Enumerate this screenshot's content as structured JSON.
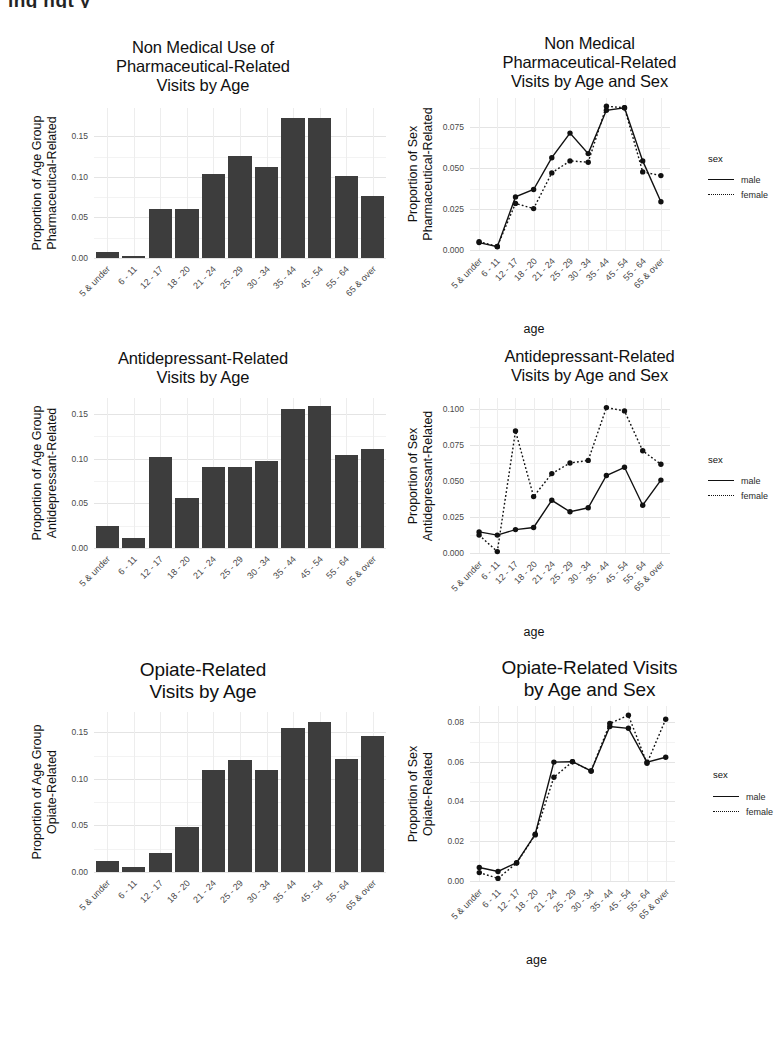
{
  "top_cropped_text": "ing ngt y",
  "categories": [
    "5 & under",
    "6 - 11",
    "12 - 17",
    "18 - 20",
    "21 - 24",
    "25 - 29",
    "30 - 34",
    "35 - 44",
    "45 - 54",
    "55 - 64",
    "65 & over"
  ],
  "legend": {
    "title": "sex",
    "items": [
      {
        "label": "male",
        "style": "solid"
      },
      {
        "label": "female",
        "style": "dotted"
      }
    ]
  },
  "axis_title_x": "age",
  "panels": [
    {
      "id": "p1",
      "title_lines": [
        "Non Medical Use of",
        "Pharmaceutical-Related",
        "Visits by Age"
      ],
      "ylabel_lines": [
        "Proportion of Age Group",
        "Pharmaceutical-Related"
      ]
    },
    {
      "id": "p2",
      "title_lines": [
        "Non Medical",
        "Pharmaceutical-Related",
        "Visits by Age and Sex"
      ],
      "ylabel_lines": [
        "Proportion of Sex",
        "Pharmaceutical-Related"
      ]
    },
    {
      "id": "p3",
      "title_lines": [
        "Antidepressant-Related",
        "Visits by Age"
      ],
      "ylabel_lines": [
        "Proportion of Age Group",
        "Antidepressant-Related"
      ]
    },
    {
      "id": "p4",
      "title_lines": [
        "Antidepressant-Related",
        "Visits by Age and Sex"
      ],
      "ylabel_lines": [
        "Proportion of Sex",
        "Antidepressant-Related"
      ]
    },
    {
      "id": "p5",
      "title_lines": [
        "Opiate-Related",
        "Visits by Age"
      ],
      "ylabel_lines": [
        "Proportion of Age Group",
        "Opiate-Related"
      ]
    },
    {
      "id": "p6",
      "title_lines": [
        "Opiate-Related Visits",
        "by Age and Sex"
      ],
      "ylabel_lines": [
        "Proportion of Sex",
        "Opiate-Related"
      ]
    }
  ],
  "chart_data": [
    {
      "type": "bar",
      "panel": "p1",
      "title": "Non Medical Use of Pharmaceutical-Related Visits by Age",
      "xlabel": "",
      "ylabel": "Proportion of Age Group Pharmaceutical-Related",
      "categories": [
        "5 & under",
        "6 - 11",
        "12 - 17",
        "18 - 20",
        "21 - 24",
        "25 - 29",
        "30 - 34",
        "35 - 44",
        "45 - 54",
        "55 - 64",
        "65 & over"
      ],
      "values": [
        0.007,
        0.002,
        0.06,
        0.061,
        0.104,
        0.126,
        0.112,
        0.173,
        0.173,
        0.101,
        0.076
      ],
      "ylim": [
        0,
        0.185
      ],
      "yticks": [
        0.0,
        0.05,
        0.1,
        0.15
      ],
      "yticklabels": [
        "0.00",
        "0.05",
        "0.10",
        "0.15"
      ],
      "grid": true,
      "bar_color": "#3d3d3d"
    },
    {
      "type": "line",
      "panel": "p2",
      "title": "Non Medical Pharmaceutical-Related Visits by Age and Sex",
      "xlabel": "age",
      "ylabel": "Proportion of Sex Pharmaceutical-Related",
      "x": [
        "5 & under",
        "6 - 11",
        "12 - 17",
        "18 - 20",
        "21 - 24",
        "25 - 29",
        "30 - 34",
        "35 - 44",
        "45 - 54",
        "55 - 64",
        "65 & over"
      ],
      "series": [
        {
          "name": "male",
          "style": "solid",
          "values": [
            0.0045,
            0.002,
            0.0325,
            0.037,
            0.0565,
            0.0715,
            0.059,
            0.0855,
            0.087,
            0.0545,
            0.0295
          ]
        },
        {
          "name": "female",
          "style": "dotted",
          "values": [
            0.005,
            0.0022,
            0.0285,
            0.0253,
            0.0472,
            0.0545,
            0.0537,
            0.088,
            0.087,
            0.0478,
            0.0455
          ]
        }
      ],
      "ylim": [
        0,
        0.093
      ],
      "yticks": [
        0.0,
        0.025,
        0.05,
        0.075
      ],
      "yticklabels": [
        "0.000",
        "0.025",
        "0.050",
        "0.075"
      ],
      "grid": true,
      "legend": {
        "title": "sex",
        "position": "right"
      }
    },
    {
      "type": "bar",
      "panel": "p3",
      "title": "Antidepressant-Related Visits by Age",
      "xlabel": "",
      "ylabel": "Proportion of Age Group Antidepressant-Related",
      "categories": [
        "5 & under",
        "6 - 11",
        "12 - 17",
        "18 - 20",
        "21 - 24",
        "25 - 29",
        "30 - 34",
        "35 - 44",
        "45 - 54",
        "55 - 64",
        "65 & over"
      ],
      "values": [
        0.025,
        0.011,
        0.102,
        0.056,
        0.091,
        0.091,
        0.097,
        0.156,
        0.159,
        0.104,
        0.111
      ],
      "ylim": [
        0,
        0.168
      ],
      "yticks": [
        0.0,
        0.05,
        0.1,
        0.15
      ],
      "yticklabels": [
        "0.00",
        "0.05",
        "0.10",
        "0.15"
      ],
      "grid": true,
      "bar_color": "#3d3d3d"
    },
    {
      "type": "line",
      "panel": "p4",
      "title": "Antidepressant-Related Visits by Age and Sex",
      "xlabel": "age",
      "ylabel": "Proportion of Sex Antidepressant-Related",
      "x": [
        "5 & under",
        "6 - 11",
        "12 - 17",
        "18 - 20",
        "21 - 24",
        "25 - 29",
        "30 - 34",
        "35 - 44",
        "45 - 54",
        "55 - 64",
        "65 & over"
      ],
      "series": [
        {
          "name": "male",
          "style": "solid",
          "values": [
            0.0147,
            0.0125,
            0.0163,
            0.0178,
            0.0367,
            0.0287,
            0.0315,
            0.054,
            0.0597,
            0.0333,
            0.0508
          ]
        },
        {
          "name": "female",
          "style": "dotted",
          "values": [
            0.0125,
            0.001,
            0.085,
            0.0393,
            0.0553,
            0.0627,
            0.0645,
            0.1013,
            0.099,
            0.0712,
            0.0618
          ]
        }
      ],
      "ylim": [
        0,
        0.108
      ],
      "yticks": [
        0.0,
        0.025,
        0.05,
        0.075,
        0.1
      ],
      "yticklabels": [
        "0.000",
        "0.025",
        "0.050",
        "0.075",
        "0.100"
      ],
      "grid": true,
      "legend": {
        "title": "sex",
        "position": "right"
      }
    },
    {
      "type": "bar",
      "panel": "p5",
      "title": "Opiate-Related Visits by Age",
      "xlabel": "",
      "ylabel": "Proportion of Age Group Opiate-Related",
      "categories": [
        "5 & under",
        "6 - 11",
        "12 - 17",
        "18 - 20",
        "21 - 24",
        "25 - 29",
        "30 - 34",
        "35 - 44",
        "45 - 54",
        "55 - 64",
        "65 & over"
      ],
      "values": [
        0.012,
        0.005,
        0.02,
        0.048,
        0.11,
        0.12,
        0.11,
        0.155,
        0.161,
        0.121,
        0.146
      ],
      "ylim": [
        0,
        0.172
      ],
      "yticks": [
        0.0,
        0.05,
        0.1,
        0.15
      ],
      "yticklabels": [
        "0.00",
        "0.05",
        "0.10",
        "0.15"
      ],
      "grid": true,
      "bar_color": "#3d3d3d"
    },
    {
      "type": "line",
      "panel": "p6",
      "title": "Opiate-Related Visits by Age and Sex",
      "xlabel": "age",
      "ylabel": "Proportion of Sex Opiate-Related",
      "x": [
        "5 & under",
        "6 - 11",
        "12 - 17",
        "18 - 20",
        "21 - 24",
        "25 - 29",
        "30 - 34",
        "35 - 44",
        "45 - 54",
        "55 - 64",
        "65 & over"
      ],
      "series": [
        {
          "name": "male",
          "style": "solid",
          "values": [
            0.0068,
            0.0048,
            0.0092,
            0.0235,
            0.0598,
            0.06,
            0.0553,
            0.0777,
            0.0768,
            0.0598,
            0.0622
          ]
        },
        {
          "name": "female",
          "style": "dotted",
          "values": [
            0.0042,
            0.0013,
            0.009,
            0.0232,
            0.0522,
            0.06,
            0.0553,
            0.0792,
            0.0833,
            0.0592,
            0.0813
          ]
        }
      ],
      "ylim": [
        0,
        0.088
      ],
      "yticks": [
        0.0,
        0.02,
        0.04,
        0.06,
        0.08
      ],
      "yticklabels": [
        "0.00",
        "0.02",
        "0.04",
        "0.06",
        "0.08"
      ],
      "grid": true,
      "legend": {
        "title": "sex",
        "position": "right"
      }
    }
  ]
}
